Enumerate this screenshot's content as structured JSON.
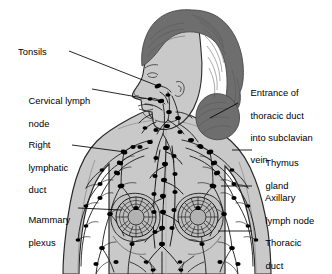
{
  "figure": {
    "background_color": "#ffffff"
  },
  "colors": {
    "background": "#ffffff",
    "skin_fill": "#c9c9c9",
    "skin_shadow": "#b4b4b4",
    "hair_fill": "#6e6e6e",
    "hair_stroke": "#4a4a4a",
    "outline": "#2b2b2b",
    "vessel": "#1a1a1a",
    "node": "#000000",
    "leader": "#000000",
    "label_text": "#000000",
    "breast_plexus_fill": "#bdbdbd"
  },
  "labels": {
    "left": [
      {
        "id": "tonsils",
        "name": "Tonsils",
        "lines": [
          "Tonsils"
        ],
        "x": 18,
        "y": 46,
        "leader": {
          "x1": 69,
          "y1": 51,
          "x2": 158,
          "y2": 86
        }
      },
      {
        "id": "cervical-lymph-node",
        "name": "Cervical lymph node",
        "lines": [
          "Cervical lymph",
          "node"
        ],
        "x": 18,
        "y": 84,
        "leader": {
          "x1": 92,
          "y1": 89,
          "x2": 160,
          "y2": 101
        }
      },
      {
        "id": "right-lymphatic-duct",
        "name": "Right lymphatic duct",
        "lines": [
          "Right",
          "lymphatic",
          "duct"
        ],
        "x": 18,
        "y": 128,
        "leader": {
          "x1": 72,
          "y1": 145,
          "x2": 125,
          "y2": 152
        }
      },
      {
        "id": "mammary-plexus",
        "name": "Mammary plexus",
        "lines": [
          "Mammary",
          "plexus"
        ],
        "x": 18,
        "y": 203,
        "leader": {
          "x1": 78,
          "y1": 208,
          "x2": 122,
          "y2": 210
        }
      }
    ],
    "right": [
      {
        "id": "entrance-thoracic-duct",
        "name": "Entrance of thoracic duct into subclavian vein",
        "lines": [
          "Entrance of",
          "thoracic duct",
          "into subclavian",
          "vein"
        ],
        "x": 240,
        "y": 76,
        "leader": {
          "x1": 238,
          "y1": 103,
          "x2": 210,
          "y2": 118
        }
      },
      {
        "id": "thymus-gland",
        "name": "Thymus gland",
        "lines": [
          "Thymus",
          "gland"
        ],
        "x": 255,
        "y": 146,
        "leader": {
          "x1": 252,
          "y1": 150,
          "x2": 232,
          "y2": 150
        }
      },
      {
        "id": "axillary-lymph-node",
        "name": "Axillary lymph node",
        "lines": [
          "Axillary",
          "lymph node"
        ],
        "x": 255,
        "y": 181,
        "leader": {
          "x1": 252,
          "y1": 186,
          "x2": 221,
          "y2": 186
        }
      },
      {
        "id": "thoracic-duct",
        "name": "Thoracic duct",
        "lines": [
          "Thoracic",
          "duct"
        ],
        "x": 255,
        "y": 226,
        "leader": {
          "x1": 252,
          "y1": 231,
          "x2": 218,
          "y2": 231
        }
      }
    ]
  },
  "anatomy": {
    "structures": [
      "head-profile-facing-left",
      "hair-with-bun",
      "neck",
      "shoulders",
      "left-arm",
      "right-arm",
      "chest",
      "left-breast",
      "right-breast",
      "lymph-vessel-network",
      "lymph-nodes"
    ],
    "node_count_visible": 72
  }
}
